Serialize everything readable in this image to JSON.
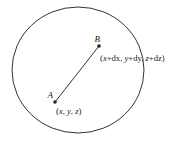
{
  "diagram": {
    "colors": {
      "stroke": "#333333",
      "text": "#222222",
      "background": "#ffffff"
    },
    "points": [
      {
        "id": "A",
        "name": "A",
        "coordinate_label_parts": [
          "(",
          "x",
          ", ",
          "y",
          ", ",
          "z",
          ")"
        ]
      },
      {
        "id": "B",
        "name": "B",
        "coordinate_label_parts": [
          "(",
          "x",
          "+dx, ",
          "y",
          "+dy, ",
          "z",
          "+dz)"
        ]
      }
    ],
    "coordinate_labels": {
      "A": "(x, y, z)",
      "B": "(x+dx, y+dy, z+dz)"
    },
    "segment": {
      "from": "A",
      "to": "B"
    },
    "boundary": "circle"
  }
}
